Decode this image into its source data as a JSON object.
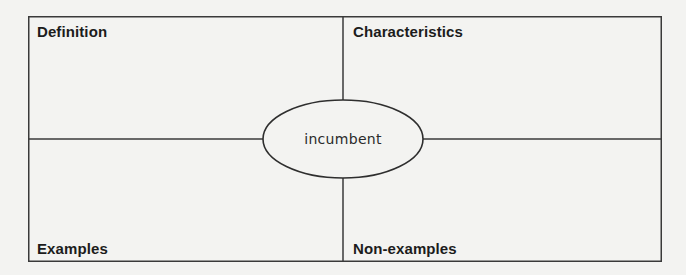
{
  "diagram": {
    "type": "frayer-model",
    "center_term": "incumbent",
    "quadrants": {
      "top_left": {
        "label": "Definition"
      },
      "top_right": {
        "label": "Characteristics"
      },
      "bottom_left": {
        "label": "Examples"
      },
      "bottom_right": {
        "label": "Non-examples"
      }
    },
    "colors": {
      "background": "#f3f3f1",
      "line": "#3a3a3a",
      "text": "#1c1c1c"
    }
  }
}
